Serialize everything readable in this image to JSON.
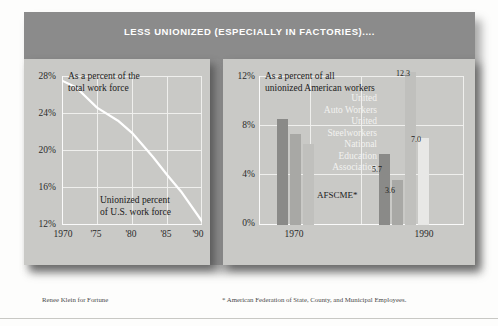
{
  "header": {
    "title": "LESS UNIONIZED (ESPECIALLY IN FACTORIES)...."
  },
  "footnotes": {
    "credit": "Renee Klein for Fortune",
    "asterisk": "* American Federation of State, County, and Municipal Employees."
  },
  "colors": {
    "header_band": "#8b8b8b",
    "panel_bg": "#c9c9c6",
    "gridline": "#efefed",
    "line_series": "#ffffff",
    "bar_dark": "#8a8a88",
    "bar_medium": "#a8a8a5",
    "bar_light": "#c0c0bd",
    "bar_lightest": "#e8e8e6",
    "text": "#202020"
  },
  "chart_data": [
    {
      "type": "line",
      "title": "As a percent of the total work force",
      "annotation": "Unionized percent of U.S. work force",
      "xlabel": "",
      "ylabel": "",
      "ylim": [
        12,
        28
      ],
      "yticks": [
        "12%",
        "16%",
        "20%",
        "24%",
        "28%"
      ],
      "ytick_values": [
        12,
        16,
        20,
        24,
        28
      ],
      "xticks": [
        "1970",
        "'75",
        "'80",
        "'85",
        "'90"
      ],
      "xtick_values": [
        1970,
        1975,
        1980,
        1985,
        1990
      ],
      "grid": true,
      "x": [
        1970,
        1972,
        1975,
        1978,
        1980,
        1983,
        1985,
        1987,
        1990
      ],
      "values": [
        27.5,
        26.8,
        24.6,
        23.2,
        21.9,
        19.3,
        17.4,
        15.6,
        12.4
      ]
    },
    {
      "type": "bar",
      "title": "As a percent of all unionized American workers",
      "ylim": [
        0,
        12
      ],
      "yticks": [
        "0%",
        "4%",
        "8%",
        "12%"
      ],
      "ytick_values": [
        0,
        4,
        8,
        12
      ],
      "categories": [
        "1970",
        "1990"
      ],
      "grid": true,
      "legend_position": "inline-upper-right",
      "series": [
        {
          "name": "United Auto Workers",
          "values": [
            8.5,
            5.7
          ],
          "color": "#8a8a88"
        },
        {
          "name": "United Steelworkers",
          "values": [
            7.3,
            3.6
          ],
          "color": "#a8a8a5"
        },
        {
          "name": "National Education Association",
          "values": [
            6.5,
            12.3
          ],
          "color": "#c0c0bd"
        },
        {
          "name": "AFSCME*",
          "values": [
            null,
            7.0
          ],
          "color": "#e8e8e6"
        }
      ],
      "data_labels": [
        {
          "label": "5.7",
          "series": "United Auto Workers",
          "category": "1990"
        },
        {
          "label": "3.6",
          "series": "United Steelworkers",
          "category": "1990"
        },
        {
          "label": "12.3",
          "series": "National Education Association",
          "category": "1990"
        },
        {
          "label": "7.0",
          "series": "AFSCME*",
          "category": "1990"
        }
      ],
      "inline_annotation": "AFSCME*"
    }
  ],
  "left_chart": {
    "caption_line1": "As a percent of the",
    "caption_line2": "total work force",
    "annotation_line1": "Unionized percent",
    "annotation_line2": "of U.S. work force",
    "ytick_0": "12%",
    "ytick_1": "16%",
    "ytick_2": "20%",
    "ytick_3": "24%",
    "ytick_4": "28%",
    "xtick_0": "1970",
    "xtick_1": "'75",
    "xtick_2": "'80",
    "xtick_3": "'85",
    "xtick_4": "'90"
  },
  "right_chart": {
    "caption_line1": "As a percent of all",
    "caption_line2": "unionized American workers",
    "legend_l1": "United",
    "legend_l2": "Auto Workers",
    "legend_l3": "United",
    "legend_l4": "Steelworkers",
    "legend_l5": "National",
    "legend_l6": "Education",
    "legend_l7": "Association",
    "afscme_label": "AFSCME*",
    "ytick_0": "0%",
    "ytick_1": "4%",
    "ytick_2": "8%",
    "ytick_3": "12%",
    "group_1970": "1970",
    "group_1990": "1990",
    "value_57": "5.7",
    "value_36": "3.6",
    "value_123": "12.3",
    "value_70": "7.0"
  }
}
